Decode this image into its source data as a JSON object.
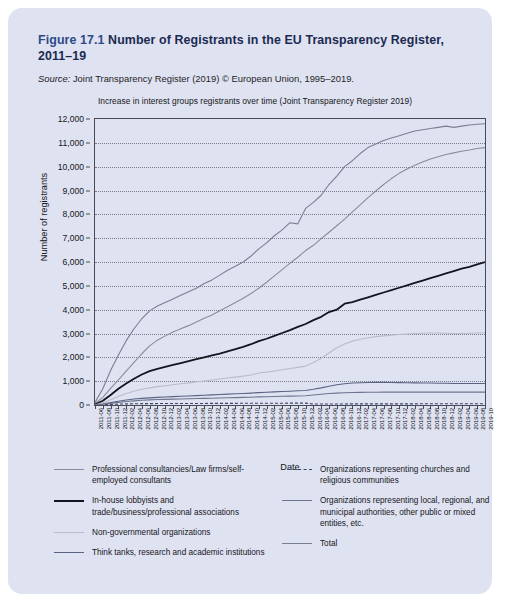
{
  "figure": {
    "label": "Figure 17.1",
    "title": "Number of Registrants in the EU Transparency Register, 2011–19",
    "source_prefix": "Source:",
    "source_text": " Joint Transparency Register (2019) © European Union, 1995–2019."
  },
  "colors": {
    "panel_background": "#dfe2f0",
    "title_text": "#1b2a52",
    "axis": "#4a4a55",
    "series_professional": "#8a8c9c",
    "series_inhouse": "#14141e",
    "series_ngo": "#b9bcc9",
    "series_thinktanks": "#5a6386",
    "series_churches": "#3b4568",
    "series_local": "#6f7590",
    "series_total": "#7b7f92"
  },
  "chart_data": {
    "type": "line",
    "title": "Increase in interest groups registrants over time (Joint Transparency Register 2019)",
    "xlabel": "Date",
    "ylabel": "Number of registrants",
    "ylim": [
      0,
      12000
    ],
    "ytick_step": 1000,
    "yticks": [
      "0",
      "1,000",
      "2,000",
      "3,000",
      "4,000",
      "5,000",
      "6,000",
      "7,000",
      "8,000",
      "9,000",
      "10,000",
      "11,000",
      "12,000"
    ],
    "grid": "horizontal-dotted",
    "legend_position": "below-two-columns",
    "x": [
      "2011-06",
      "2011-08",
      "2011-10",
      "2011-12",
      "2012-02",
      "2012-04",
      "2012-06",
      "2012-08",
      "2012-10",
      "2012-12",
      "2013-02",
      "2013-04",
      "2013-06",
      "2013-08",
      "2013-10",
      "2013-12",
      "2014-02",
      "2014-04",
      "2014-06",
      "2014-08",
      "2014-10",
      "2014-12",
      "2015-02",
      "2015-04",
      "2015-06",
      "2015-08",
      "2015-10",
      "2015-12",
      "2016-02",
      "2016-04",
      "2016-06",
      "2016-08",
      "2016-10",
      "2016-12",
      "2017-02",
      "2017-04",
      "2017-06",
      "2017-08",
      "2017-10",
      "2017-12",
      "2018-02",
      "2018-04",
      "2018-06",
      "2018-08",
      "2018-10",
      "2018-12",
      "2019-02",
      "2019-04",
      "2019-06",
      "2019-08",
      "2019-10"
    ],
    "series": [
      {
        "name": "Professional consultancies/Law firms/self-employed consultants",
        "color": "#8a8c9c",
        "dash": "solid",
        "values": [
          60,
          320,
          700,
          1050,
          1420,
          1790,
          2150,
          2480,
          2720,
          2900,
          3060,
          3200,
          3330,
          3480,
          3640,
          3780,
          3950,
          4120,
          4300,
          4480,
          4680,
          4900,
          5150,
          5420,
          5680,
          5950,
          6200,
          6480,
          6700,
          6980,
          7250,
          7520,
          7800,
          8100,
          8400,
          8700,
          8980,
          9250,
          9500,
          9720,
          9900,
          10060,
          10200,
          10320,
          10420,
          10510,
          10580,
          10650,
          10700,
          10760,
          10800
        ]
      },
      {
        "name": "In-house lobbyists and trade/business/professional associations",
        "color": "#14141e",
        "dash": "solid",
        "values": [
          20,
          180,
          420,
          680,
          900,
          1100,
          1280,
          1420,
          1520,
          1600,
          1680,
          1760,
          1840,
          1920,
          2000,
          2080,
          2160,
          2250,
          2340,
          2440,
          2550,
          2680,
          2780,
          2900,
          3020,
          3140,
          3280,
          3400,
          3560,
          3700,
          3900,
          4000,
          4250,
          4320,
          4420,
          4520,
          4620,
          4720,
          4820,
          4920,
          5020,
          5120,
          5220,
          5320,
          5420,
          5520,
          5620,
          5720,
          5800,
          5900,
          6000
        ]
      },
      {
        "name": "Non-governmental organizations",
        "color": "#b9bcc9",
        "dash": "solid",
        "values": [
          10,
          90,
          220,
          360,
          480,
          580,
          660,
          720,
          770,
          810,
          850,
          890,
          930,
          970,
          1010,
          1050,
          1090,
          1130,
          1170,
          1210,
          1260,
          1340,
          1380,
          1430,
          1480,
          1530,
          1580,
          1630,
          1780,
          1960,
          2180,
          2400,
          2560,
          2680,
          2760,
          2820,
          2870,
          2900,
          2930,
          2960,
          2980,
          3000,
          3010,
          3020,
          3020,
          3010,
          3000,
          3000,
          3010,
          3020,
          3030
        ]
      },
      {
        "name": "Think tanks, research and academic institutions",
        "color": "#5a6386",
        "dash": "solid",
        "values": [
          5,
          40,
          100,
          160,
          210,
          250,
          280,
          300,
          320,
          335,
          350,
          365,
          380,
          395,
          410,
          425,
          440,
          455,
          470,
          485,
          500,
          520,
          535,
          550,
          565,
          580,
          595,
          610,
          660,
          720,
          790,
          850,
          890,
          920,
          935,
          945,
          950,
          950,
          945,
          940,
          935,
          930,
          925,
          920,
          915,
          910,
          905,
          900,
          900,
          900,
          900
        ]
      },
      {
        "name": "Organizations representing churches and religious communities",
        "color": "#3b4568",
        "dash": "dashed",
        "values": [
          2,
          12,
          26,
          38,
          46,
          52,
          56,
          58,
          60,
          61,
          62,
          63,
          64,
          65,
          66,
          67,
          68,
          69,
          70,
          71,
          72,
          73,
          74,
          75,
          76,
          77,
          78,
          79,
          41,
          42,
          43,
          44,
          45,
          46,
          47,
          47,
          48,
          48,
          48,
          49,
          49,
          49,
          50,
          50,
          50,
          50,
          50,
          50,
          50,
          50,
          50
        ]
      },
      {
        "name": "Organizations representing local, regional, and municipal authorities, other public or mixed entities, etc.",
        "color": "#6f7590",
        "dash": "solid",
        "values": [
          4,
          30,
          70,
          110,
          145,
          175,
          200,
          215,
          228,
          238,
          246,
          254,
          262,
          270,
          278,
          286,
          294,
          302,
          310,
          318,
          328,
          340,
          348,
          356,
          364,
          372,
          380,
          388,
          420,
          450,
          480,
          500,
          515,
          525,
          530,
          535,
          538,
          540,
          540,
          540,
          540,
          540,
          540,
          540,
          540,
          540,
          540,
          540,
          540,
          540,
          540
        ]
      },
      {
        "name": "Total",
        "color": "#7b7f92",
        "dash": "solid",
        "values": [
          101,
          672,
          1538,
          2398,
          3201,
          3947,
          4626,
          5193,
          5620,
          5945,
          6248,
          6532,
          6810,
          7100,
          7404,
          7688,
          8002,
          8327,
          8660,
          9003,
          9388,
          9853,
          10267,
          10731,
          11189,
          11652,
          12113,
          12587,
          13161,
          13852,
          14643,
          15314,
          16060,
          16613,
          17092,
          17569,
          18006,
          18408,
          18783,
          19131,
          19424,
          19700,
          19945,
          20172,
          20365,
          20540,
          20693,
          20860,
          21000,
          21170,
          21320
        ]
      }
    ],
    "total_axis_values": [
      110,
      680,
      1450,
      2100,
      2700,
      3200,
      3620,
      3950,
      4150,
      4300,
      4450,
      4600,
      4750,
      4900,
      5100,
      5250,
      5450,
      5650,
      5820,
      6000,
      6250,
      6550,
      6800,
      7100,
      7350,
      7650,
      7600,
      8250,
      8500,
      8800,
      9250,
      9600,
      10000,
      10250,
      10550,
      10800,
      10950,
      11100,
      11200,
      11300,
      11400,
      11500,
      11550,
      11600,
      11650,
      11700,
      11650,
      11700,
      11750,
      11780,
      11800
    ]
  },
  "legend": {
    "column_a": [
      {
        "label": "Professional consultancies/Law firms/self-employed consultants",
        "color": "#8a8c9c",
        "style": "solid",
        "weight": "1.5"
      },
      {
        "label": "In-house lobbyists and trade/business/professional associations",
        "color": "#14141e",
        "style": "solid",
        "weight": "2.2"
      },
      {
        "label": "Non-governmental organizations",
        "color": "#b9bcc9",
        "style": "solid",
        "weight": "1.5"
      },
      {
        "label": "Think tanks, research and academic institutions",
        "color": "#5a6386",
        "style": "solid",
        "weight": "1.5"
      }
    ],
    "column_b": [
      {
        "label": "Organizations representing churches and religious communities",
        "color": "#3b4568",
        "style": "dashed",
        "weight": "1.5"
      },
      {
        "label": "Organizations representing local, regional, and municipal authorities, other public or mixed entities, etc.",
        "color": "#6f7590",
        "style": "solid",
        "weight": "1.5"
      },
      {
        "label": "Total",
        "color": "#7b7f92",
        "style": "solid",
        "weight": "1.5"
      }
    ]
  }
}
